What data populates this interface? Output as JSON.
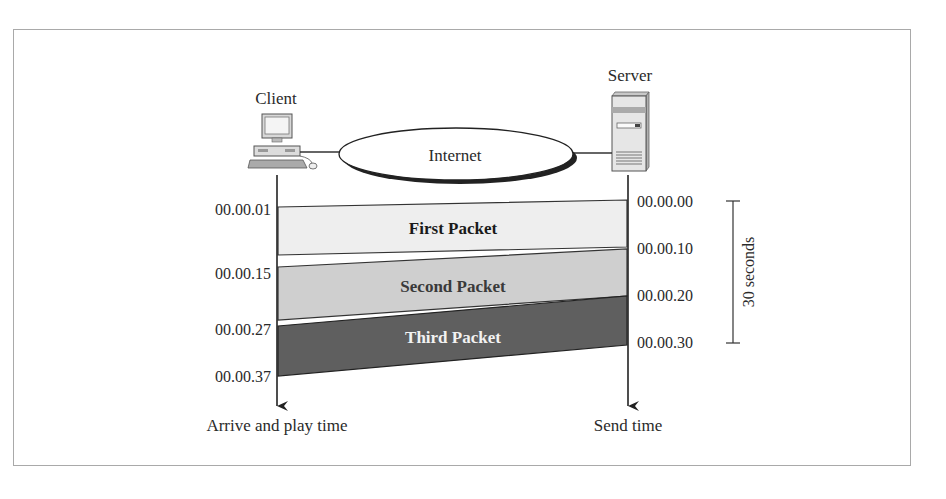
{
  "diagram": {
    "type": "timing-diagram",
    "nodes": {
      "client": {
        "label": "Client",
        "icon": "desktop-computer-icon"
      },
      "internet": {
        "label": "Internet"
      },
      "server": {
        "label": "Server",
        "icon": "tower-server-icon"
      }
    },
    "client_axis": {
      "label": "Arrive and play time",
      "ticks": [
        "00.00.01",
        "00.00.15",
        "00.00.27",
        "00.00.37"
      ]
    },
    "server_axis": {
      "label": "Send time",
      "ticks": [
        "00.00.00",
        "00.00.10",
        "00.00.20",
        "00.00.30"
      ]
    },
    "bracket": {
      "label": "30 seconds"
    },
    "packets": [
      {
        "label": "First Packet",
        "send_start": "00.00.00",
        "send_end": "00.00.10",
        "arrive_start": "00.00.01",
        "arrive_end": "00.00.15",
        "fill": "#eeeeee",
        "text_color": "#1a1a1a"
      },
      {
        "label": "Second Packet",
        "send_start": "00.00.10",
        "send_end": "00.00.20",
        "arrive_start": "00.00.15",
        "arrive_end": "00.00.27",
        "fill": "#cfcfcf",
        "text_color": "#3a3a3a"
      },
      {
        "label": "Third Packet",
        "send_start": "00.00.20",
        "send_end": "00.00.30",
        "arrive_start": "00.00.27",
        "arrive_end": "00.00.37",
        "fill": "#5f5f5f",
        "text_color": "#f2f2f2"
      }
    ]
  }
}
